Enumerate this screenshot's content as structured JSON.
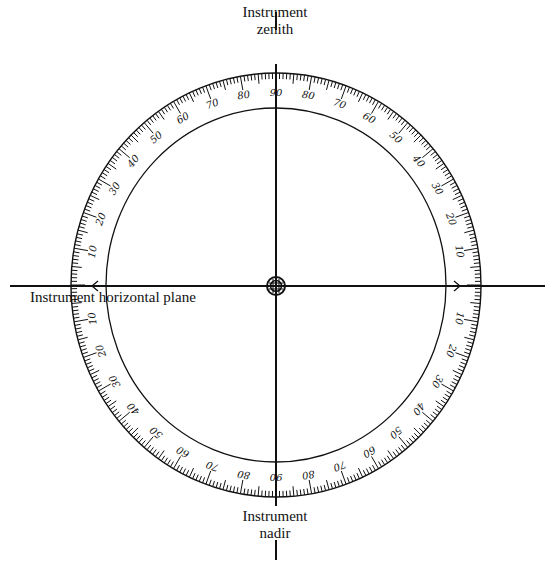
{
  "labels": {
    "zenith_line1": "Instrument",
    "zenith_line2": "zenith",
    "nadir_line1": "Instrument",
    "nadir_line2": "nadir",
    "horizontal": "Instrument horizontal plane"
  },
  "geometry": {
    "center": [
      276,
      285
    ],
    "outer_radius": [
      205,
      212
    ],
    "inner_radius": [
      170,
      177
    ],
    "vertical_axis": {
      "x": 276,
      "y_top_segment": [
        12,
        30
      ],
      "y_main": [
        64,
        506
      ],
      "y_bottom_segment": [
        540,
        560
      ]
    },
    "horizontal_axis": {
      "y": 286,
      "x": [
        10,
        545
      ]
    }
  },
  "scale": {
    "tick_step_deg": 1,
    "major_every_deg": 10,
    "mid_every_deg": 5,
    "quadrant_labels": [
      10,
      20,
      30,
      40,
      50,
      60,
      70,
      80,
      90
    ],
    "description": "Graduated vertical circle, 0 at horizontal plane, 90 at zenith and nadir, in each quadrant"
  },
  "colors": {
    "ink": "#111111",
    "background": "#ffffff"
  },
  "icons": {
    "center": "crosshair-target-icon",
    "arrow_right": "chevron-right-icon",
    "arrow_left": "chevron-left-icon"
  }
}
